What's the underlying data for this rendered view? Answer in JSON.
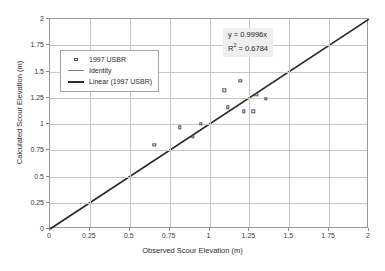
{
  "chart_data": {
    "type": "scatter",
    "title": "",
    "xlabel": "Observed Scour Elevation (m)",
    "ylabel": "Calculated Scour Elevation (m)",
    "xlim": [
      0,
      2
    ],
    "ylim": [
      0,
      2
    ],
    "xticks": [
      "0",
      "0.25",
      "0.5",
      "0.75",
      "1",
      "1.25",
      "1.5",
      "1.75",
      "2"
    ],
    "yticks": [
      "0",
      "0.25",
      "0.5",
      "0.75",
      "1",
      "1.25",
      "1.5",
      "1.75",
      "2"
    ],
    "xtick_values": [
      0,
      0.25,
      0.5,
      0.75,
      1,
      1.25,
      1.5,
      1.75,
      2
    ],
    "ytick_values": [
      0,
      0.25,
      0.5,
      0.75,
      1,
      1.25,
      1.5,
      1.75,
      2
    ],
    "grid": true,
    "legend_position": "upper-left-inside",
    "series": [
      {
        "name": "1997 USBR",
        "type": "scatter",
        "marker": "open-square",
        "color": "#4f4f6e",
        "points": [
          {
            "x": 0.66,
            "y": 0.79
          },
          {
            "x": 0.82,
            "y": 0.96
          },
          {
            "x": 0.9,
            "y": 0.87
          },
          {
            "x": 0.95,
            "y": 0.99
          },
          {
            "x": 1.1,
            "y": 1.31
          },
          {
            "x": 1.12,
            "y": 1.15
          },
          {
            "x": 1.2,
            "y": 1.4
          },
          {
            "x": 1.22,
            "y": 1.11
          },
          {
            "x": 1.28,
            "y": 1.11
          },
          {
            "x": 1.3,
            "y": 1.27
          },
          {
            "x": 1.36,
            "y": 1.23
          }
        ]
      },
      {
        "name": "Identity",
        "type": "line",
        "color": "#6a7a9a",
        "width": 1,
        "from": {
          "x": 0,
          "y": 0
        },
        "to": {
          "x": 2,
          "y": 2
        }
      },
      {
        "name": "Linear (1997 USBR)",
        "type": "line",
        "color": "#2a2a2a",
        "width": 1.6,
        "slope": 0.9996,
        "intercept": 0,
        "from": {
          "x": 0,
          "y": 0
        },
        "to": {
          "x": 2,
          "y": 1.9992
        }
      }
    ],
    "annotations": {
      "equation": "y = 0.9996x",
      "r_squared_prefix": "R",
      "r_squared_exponent": "2",
      "r_squared_value": " = 0.6784"
    }
  },
  "legend": {
    "items": [
      {
        "label": "1997 USBR",
        "key": "open-square-marker"
      },
      {
        "label": "Identity",
        "key": "thin-line"
      },
      {
        "label": "Linear (1997 USBR)",
        "key": "thick-line"
      }
    ]
  }
}
